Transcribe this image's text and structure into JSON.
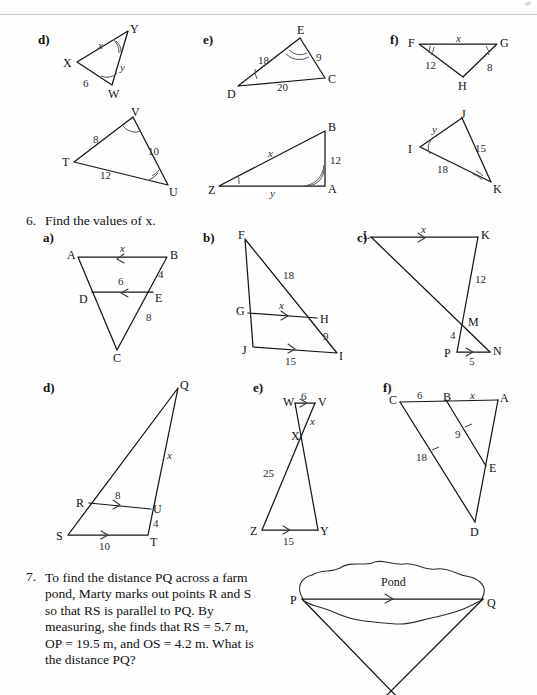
{
  "page": {
    "width": 537,
    "height": 695,
    "background": "#fefefe",
    "ink": "#151515"
  },
  "question5_continued": {
    "parts": [
      {
        "letter": "d)",
        "figures": [
          {
            "name": "triangle-XYW",
            "vertices": [
              "X",
              "Y",
              "W"
            ],
            "sides": [
              {
                "label": "x",
                "italic": true,
                "between": [
                  "X",
                  "Y"
                ]
              },
              {
                "label": "y",
                "italic": true,
                "between": [
                  "Y",
                  "W"
                ]
              },
              {
                "label": "6",
                "italic": false,
                "between": [
                  "X",
                  "W"
                ]
              }
            ],
            "angle_marks": [
              "double-arc-at-Y",
              "single-arc-at-W"
            ]
          },
          {
            "name": "triangle-TVU",
            "vertices": [
              "T",
              "V",
              "U"
            ],
            "sides": [
              {
                "label": "8",
                "italic": false,
                "between": [
                  "T",
                  "V"
                ]
              },
              {
                "label": "10",
                "italic": false,
                "between": [
                  "V",
                  "U"
                ]
              },
              {
                "label": "12",
                "italic": false,
                "between": [
                  "T",
                  "U"
                ]
              }
            ],
            "angle_marks": [
              "single-arc-at-V",
              "double-arc-at-U"
            ]
          }
        ]
      },
      {
        "letter": "e)",
        "figures": [
          {
            "name": "triangle-DEC",
            "vertices": [
              "D",
              "E",
              "C"
            ],
            "sides": [
              {
                "label": "18",
                "italic": false,
                "between": [
                  "D",
                  "E"
                ]
              },
              {
                "label": "9",
                "italic": false,
                "between": [
                  "E",
                  "C"
                ]
              },
              {
                "label": "20",
                "italic": false,
                "between": [
                  "D",
                  "C"
                ]
              }
            ],
            "angle_marks": [
              "double-arc-at-E",
              "single-arc-at-D"
            ]
          },
          {
            "name": "triangle-ZAB",
            "vertices": [
              "Z",
              "A",
              "B"
            ],
            "sides": [
              {
                "label": "x",
                "italic": true,
                "between": [
                  "Z",
                  "B"
                ]
              },
              {
                "label": "12",
                "italic": false,
                "between": [
                  "B",
                  "A"
                ]
              },
              {
                "label": "y",
                "italic": true,
                "between": [
                  "Z",
                  "A"
                ]
              }
            ],
            "angle_marks": [
              "single-arc-at-Z",
              "double-arc-at-A"
            ]
          }
        ]
      },
      {
        "letter": "f)",
        "figures": [
          {
            "name": "triangle-FGH",
            "vertices": [
              "F",
              "G",
              "H"
            ],
            "sides": [
              {
                "label": "x",
                "italic": true,
                "between": [
                  "F",
                  "G"
                ]
              },
              {
                "label": "8",
                "italic": false,
                "between": [
                  "G",
                  "H"
                ]
              },
              {
                "label": "12",
                "italic": false,
                "between": [
                  "F",
                  "H"
                ]
              }
            ],
            "angle_marks": [
              "double-arc-at-F",
              "single-arc-at-G"
            ]
          },
          {
            "name": "triangle-IJK",
            "vertices": [
              "I",
              "J",
              "K"
            ],
            "sides": [
              {
                "label": "y",
                "italic": true,
                "between": [
                  "I",
                  "J"
                ]
              },
              {
                "label": "15",
                "italic": false,
                "between": [
                  "J",
                  "K"
                ]
              },
              {
                "label": "18",
                "italic": false,
                "between": [
                  "I",
                  "K"
                ]
              }
            ],
            "angle_marks": [
              "single-arc-at-I",
              "double-arc-at-K"
            ]
          }
        ]
      }
    ]
  },
  "question6": {
    "number": "6.",
    "prompt": "Find the values of x.",
    "parts": [
      {
        "letter": "a)",
        "name": "figure-6a-triangle-ABC",
        "vertices": [
          "A",
          "B",
          "D",
          "E",
          "C"
        ],
        "labels": [
          {
            "label": "x",
            "italic": true,
            "on": "AB"
          },
          {
            "label": "6",
            "italic": false,
            "on": "DE"
          },
          {
            "label": "4",
            "italic": false,
            "on": "BE"
          },
          {
            "label": "8",
            "italic": false,
            "on": "EC"
          }
        ],
        "parallel_arrows": [
          "AB-single-left",
          "DE-single-left"
        ]
      },
      {
        "letter": "b)",
        "name": "figure-6b-triangle-FJI",
        "vertices": [
          "F",
          "G",
          "H",
          "J",
          "I"
        ],
        "labels": [
          {
            "label": "18",
            "italic": false,
            "on": "FH"
          },
          {
            "label": "x",
            "italic": true,
            "on": "GH"
          },
          {
            "label": "9",
            "italic": false,
            "on": "HI"
          },
          {
            "label": "15",
            "italic": false,
            "on": "JI"
          }
        ],
        "parallel_arrows": [
          "GH-single-right",
          "JI-single-right"
        ]
      },
      {
        "letter": "c)",
        "name": "figure-6c-triangles-LKM-PNM",
        "vertices": [
          "L",
          "K",
          "M",
          "P",
          "N"
        ],
        "labels": [
          {
            "label": "x",
            "italic": true,
            "on": "LK"
          },
          {
            "label": "12",
            "italic": false,
            "on": "KM"
          },
          {
            "label": "4",
            "italic": false,
            "on": "MP"
          },
          {
            "label": "5",
            "italic": false,
            "on": "PN"
          }
        ],
        "parallel_arrows": [
          "LK-single-right",
          "PN-single-right"
        ]
      },
      {
        "letter": "d)",
        "name": "figure-6d-triangle-QST",
        "vertices": [
          "Q",
          "R",
          "U",
          "S",
          "T"
        ],
        "labels": [
          {
            "label": "x",
            "italic": true,
            "on": "QU"
          },
          {
            "label": "8",
            "italic": false,
            "on": "RU"
          },
          {
            "label": "4",
            "italic": false,
            "on": "UT"
          },
          {
            "label": "10",
            "italic": false,
            "on": "ST"
          }
        ],
        "parallel_arrows": [
          "RU-single-right",
          "ST-single-right"
        ]
      },
      {
        "letter": "e)",
        "name": "figure-6e-bowtie-WVXZY",
        "vertices": [
          "W",
          "V",
          "X",
          "Z",
          "Y"
        ],
        "labels": [
          {
            "label": "6",
            "italic": false,
            "on": "WV"
          },
          {
            "label": "x",
            "italic": true,
            "on": "XV"
          },
          {
            "label": "25",
            "italic": false,
            "on": "XZ"
          },
          {
            "label": "15",
            "italic": false,
            "on": "ZY"
          }
        ],
        "parallel_arrows": [
          "WV-single-right",
          "ZY-single-right"
        ]
      },
      {
        "letter": "f)",
        "name": "figure-6f-triangle-CAD",
        "vertices": [
          "C",
          "B",
          "A",
          "E",
          "D"
        ],
        "labels": [
          {
            "label": "6",
            "italic": false,
            "on": "CB"
          },
          {
            "label": "x",
            "italic": true,
            "on": "BA"
          },
          {
            "label": "9",
            "italic": false,
            "on": "BE"
          },
          {
            "label": "18",
            "italic": false,
            "on": "CD"
          }
        ],
        "tick_marks": [
          "single-tick-on-BE",
          "single-tick-on-CD"
        ]
      }
    ]
  },
  "question7": {
    "number": "7.",
    "text": "To find the distance PQ across a farm pond, Marty marks out points R and S so that RS is parallel to PQ. By measuring, she finds that RS = 5.7 m, OP = 19.5 m, and OS = 4.2 m. What is the distance PQ?",
    "figure": {
      "name": "pond-diagram",
      "pond_label": "Pond",
      "point_left": "P",
      "point_right": "Q",
      "parallel_arrow": "PQ-single-right"
    }
  }
}
